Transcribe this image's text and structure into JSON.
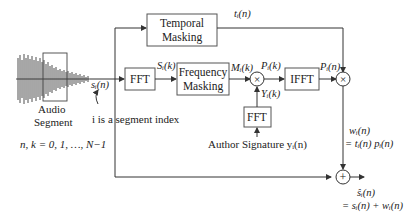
{
  "diagram": {
    "blocks": {
      "temporal_masking": [
        "Temporal",
        "Masking"
      ],
      "fft_main": "FFT",
      "frequency_masking": [
        "Frequency",
        "Masking"
      ],
      "ifft": "IFFT",
      "fft_signature": "FFT"
    },
    "signals": {
      "s_i_n": "sᵢ(n)",
      "S_i_k": "Sᵢ(k)",
      "M_i_k": "Mᵢ(k)",
      "P_i_k": "Pᵢ(k)",
      "Y_i_k": "Yᵢ(k)",
      "P_i_n": "Pᵢ(n)",
      "t_i_n": "tᵢ(n)",
      "w_i_n": "wᵢ(n)",
      "w_i_n_eq": "= tᵢ(n) pᵢ(n)",
      "s_hat": "ŝᵢ(n)",
      "s_hat_eq": "= sᵢ(n) + wᵢ(n)"
    },
    "labels": {
      "audio_segment": [
        "Audio",
        "Segment"
      ],
      "segment_index": "i is a segment index",
      "index_range": "n, k = 0, 1, …, N−1",
      "author_signature": "Author Signature yᵢ(n)",
      "watermarked_segment": [
        "Watermarked",
        "Segment"
      ]
    },
    "operators": {
      "multiply": "×",
      "add": "+"
    }
  }
}
